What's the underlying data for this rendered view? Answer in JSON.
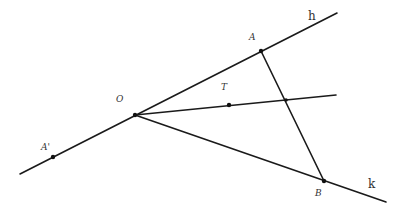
{
  "diagram": {
    "type": "geometry-figure",
    "colors": {
      "stroke": "#1a1a1a",
      "label": "#333333",
      "background": "#ffffff"
    },
    "points": [
      {
        "id": "O",
        "label": "O",
        "x": 135,
        "y": 115,
        "label_x": 116,
        "label_y": 102
      },
      {
        "id": "A",
        "label": "A",
        "x": 261,
        "y": 51,
        "label_x": 249,
        "label_y": 40
      },
      {
        "id": "B",
        "label": "B",
        "x": 324,
        "y": 181,
        "label_x": 315,
        "label_y": 196
      },
      {
        "id": "T",
        "label": "T",
        "x": 229,
        "y": 105,
        "label_x": 221,
        "label_y": 90
      },
      {
        "id": "A'",
        "label": "A'",
        "x": 53,
        "y": 157,
        "label_x": 41,
        "label_y": 150
      },
      {
        "id": "X",
        "label": "",
        "x": 286,
        "y": 100
      }
    ],
    "rays": [
      {
        "id": "h",
        "label": "h",
        "from": [
          20,
          174
        ],
        "to": [
          337,
          13
        ],
        "label_x": 308,
        "label_y": 20
      },
      {
        "id": "k",
        "label": "k",
        "from": [
          135,
          115
        ],
        "to": [
          386,
          202
        ],
        "label_x": 368,
        "label_y": 188
      },
      {
        "id": "OT",
        "label": "",
        "from": [
          135,
          115
        ],
        "to": [
          336,
          95
        ]
      }
    ],
    "segments": [
      {
        "id": "AB",
        "from": [
          261,
          51
        ],
        "to": [
          324,
          181
        ]
      }
    ]
  }
}
